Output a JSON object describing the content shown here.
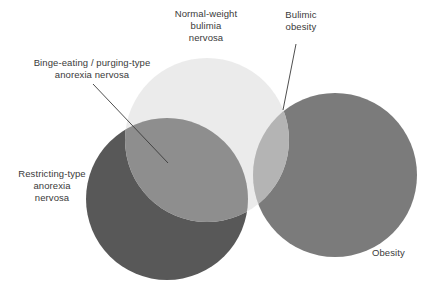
{
  "figure": {
    "type": "venn-diagram",
    "background_color": "#ffffff",
    "text_color": "#3a3a3a"
  },
  "labels": {
    "normal_weight_bulimia_nervosa": "Normal-weight\nbulimia\nnervosa",
    "bulimic_obesity": "Bulimic\nobesity",
    "binge_eating_purging_type": "Binge-eating / purging-type\nanorexia nervosa",
    "restricting_type": "Restricting-type\nanorexia\nnervosa",
    "obesity": "Obesity"
  },
  "chart_data": {
    "type": "venn",
    "title": "",
    "sets": [
      {
        "name": "Restricting-type anorexia nervosa",
        "label": "Restricting-type\nanorexia\nnervosa",
        "color": "#585858",
        "cx": 167,
        "cy": 199,
        "r": 81
      },
      {
        "name": "Normal-weight bulimia nervosa",
        "label": "Normal-weight\nbulimia\nnervosa",
        "color": "#e9e9e9",
        "cx": 207,
        "cy": 140,
        "r": 82
      },
      {
        "name": "Obesity",
        "label": "Obesity",
        "color": "#7b7b7b",
        "cx": 335,
        "cy": 175,
        "r": 82
      }
    ],
    "intersections": [
      {
        "name": "Binge-eating / purging-type anorexia nervosa",
        "label": "Binge-eating / purging-type\nanorexia nervosa",
        "between": [
          "Restricting-type anorexia nervosa",
          "Normal-weight bulimia nervosa"
        ],
        "color": "#8e8e8e"
      },
      {
        "name": "Bulimic obesity",
        "label": "Bulimic\nobesity",
        "between": [
          "Normal-weight bulimia nervosa",
          "Obesity"
        ],
        "color": "#b4b4b4"
      }
    ],
    "leader_lines": [
      {
        "from_label": "Binge-eating / purging-type anorexia nervosa",
        "x1": 93,
        "y1": 84,
        "x2": 168,
        "y2": 163
      },
      {
        "from_label": "Bulimic obesity",
        "x1": 296,
        "y1": 44,
        "x2": 283,
        "y2": 110
      }
    ],
    "leader_line_color": "#3a3a3a",
    "legend_position": "inline-annotations",
    "grid": false
  }
}
